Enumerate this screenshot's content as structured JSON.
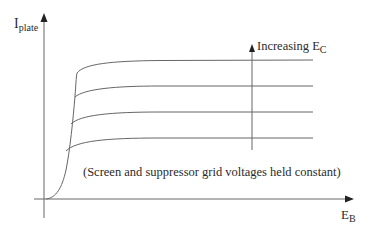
{
  "diagram": {
    "y_axis": {
      "label": "I",
      "label_sub": "plate"
    },
    "x_axis": {
      "label": "E",
      "label_sub": "B"
    },
    "direction_arrow": {
      "label": "Increasing E",
      "label_sub": "C"
    },
    "note": "(Screen and suppressor grid voltages held constant)",
    "curves": [
      {
        "name": "curve-1",
        "plateau_y": 72
      },
      {
        "name": "curve-2",
        "plateau_y": 98
      },
      {
        "name": "curve-3",
        "plateau_y": 125
      },
      {
        "name": "curve-4",
        "plateau_y": 152
      }
    ],
    "colors": {
      "line": "#555555",
      "text": "#2a2a2a",
      "background": "#ffffff"
    }
  }
}
